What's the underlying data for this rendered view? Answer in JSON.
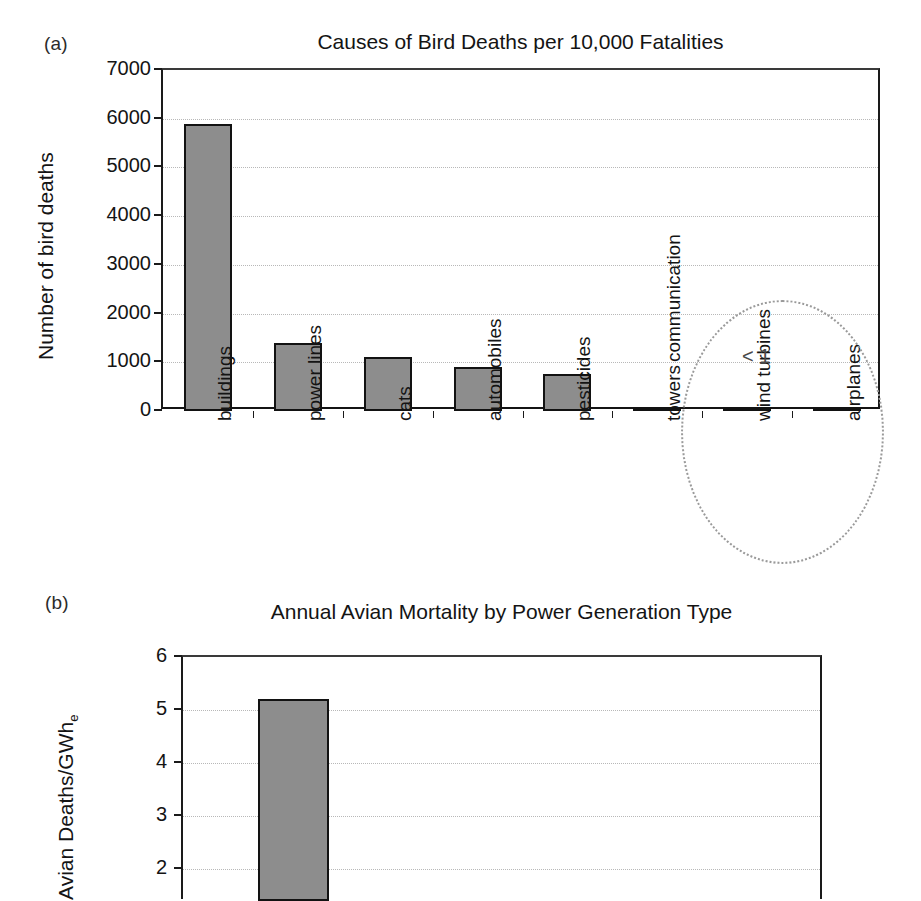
{
  "figure": {
    "panel_a_letter": "(a)",
    "panel_b_letter": "(b)"
  },
  "chart_data": [
    {
      "id": "panel-a",
      "type": "bar",
      "title": "Causes of Bird Deaths per 10,000 Fatalities",
      "xlabel": "",
      "ylabel": "Number of bird deaths",
      "ylim": [
        0,
        7000
      ],
      "ytick_labels": [
        "0",
        "1000",
        "2000",
        "3000",
        "4000",
        "5000",
        "6000",
        "7000"
      ],
      "ytick_values": [
        0,
        1000,
        2000,
        3000,
        4000,
        5000,
        6000,
        7000
      ],
      "grid": true,
      "legend": "none",
      "categories": [
        "buildings",
        "power lines",
        "cats",
        "automobiles",
        "pesticides",
        "communication\ntowers",
        "wind turbines",
        "airplanes"
      ],
      "values": [
        5900,
        1400,
        1100,
        900,
        760,
        70,
        0.5,
        0.5
      ],
      "annotations": [
        {
          "text": "< 1",
          "target": [
            "wind turbines",
            "airplanes"
          ],
          "marker": "dotted-ellipse"
        }
      ],
      "colors": {
        "bar_fill": "#8d8d8d",
        "bar_edge": "#121212",
        "grid": "#b8b8b8",
        "axis": "#1a1a1a"
      }
    },
    {
      "id": "panel-b",
      "type": "bar",
      "title": "Annual Avian Mortality by Power Generation Type",
      "xlabel": "",
      "ylabel": "Avian Deaths/GWh",
      "ylabel_subscript": "e",
      "ylim": [
        0,
        6
      ],
      "ytick_labels": [
        "2",
        "3",
        "4",
        "5",
        "6"
      ],
      "ytick_values": [
        2,
        3,
        4,
        5,
        6
      ],
      "grid": true,
      "legend": "none",
      "note": "panel cropped at image bottom edge; only first bar visible",
      "categories": [
        ""
      ],
      "values": [
        5.2
      ],
      "colors": {
        "bar_fill": "#8d8d8d",
        "bar_edge": "#121212",
        "grid": "#b8b8b8",
        "axis": "#1a1a1a"
      }
    }
  ]
}
